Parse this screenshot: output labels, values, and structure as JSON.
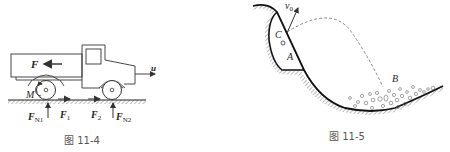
{
  "figures": [
    {
      "id": "fig-11-4",
      "caption": "图 11-4",
      "subject": "truck on road with forces",
      "labels": {
        "force_F": "F",
        "velocity_u": "u",
        "moment_M": "M",
        "normal_rear": "F",
        "normal_rear_sub": "N1",
        "normal_front": "F",
        "normal_front_sub": "N2",
        "friction_rear": "F",
        "friction_rear_sub": "1",
        "friction_front": "F",
        "friction_front_sub": "2"
      }
    },
    {
      "id": "fig-11-5",
      "caption": "图 11-5",
      "subject": "projectile launched from cliff pocket onto slope",
      "labels": {
        "initial_velocity": "v",
        "initial_velocity_sub": "0",
        "point_C": "C",
        "point_A": "A",
        "point_B": "B"
      }
    }
  ],
  "colors": {
    "line": "#222222",
    "hatch": "#777777",
    "caption": "#555555",
    "background": "#ffffff"
  }
}
